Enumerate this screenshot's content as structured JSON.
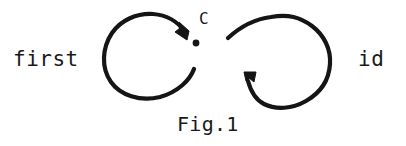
{
  "figure": {
    "caption": "Fig.1",
    "background_color": "#ffffff",
    "ink_color": "#151515",
    "style": "hand-drawn diagram"
  },
  "labels": {
    "left": "first",
    "right": "id",
    "node": "C"
  },
  "diagram": {
    "node_name": "C",
    "node_point": {
      "x": 196,
      "y": 43
    },
    "loops": [
      {
        "name": "left-loop",
        "label": "first",
        "direction": "clockwise",
        "arrow_target": "C",
        "arrowhead_at": {
          "x": 183,
          "y": 36
        },
        "description": "near-complete circle left of C, gap on right, arrowhead pointing down-right into C"
      },
      {
        "name": "right-loop",
        "label": "id",
        "direction": "counter-clockwise",
        "arrow_target": "C",
        "arrowhead_at": {
          "x": 248,
          "y": 76
        },
        "description": "large rounded loop right of C, gap on left, arrowhead pointing left into C"
      }
    ]
  }
}
